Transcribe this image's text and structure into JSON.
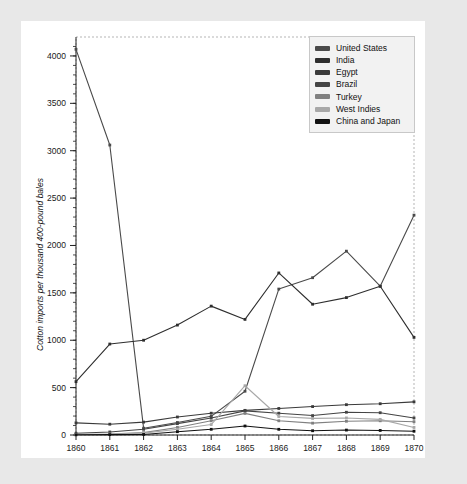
{
  "chart_data": {
    "type": "line",
    "title": "",
    "xlabel": "",
    "ylabel": "Cotton imports per thousand 400-pound bales",
    "categories": [
      "1860",
      "1861",
      "1862",
      "1863",
      "1864",
      "1865",
      "1866",
      "1867",
      "1868",
      "1869",
      "1870"
    ],
    "x": [
      1860,
      1861,
      1862,
      1863,
      1864,
      1865,
      1866,
      1867,
      1868,
      1869,
      1870
    ],
    "xlim": [
      1860,
      1870
    ],
    "ylim": [
      0,
      4200
    ],
    "yticks": [
      0,
      500,
      1000,
      1500,
      2000,
      2500,
      3000,
      3500,
      4000
    ],
    "grid": false,
    "legend_position": "top-right",
    "series": [
      {
        "name": "United States",
        "color": "#4a4a4a",
        "values": [
          4070,
          3060,
          72,
          132,
          197,
          462,
          1540,
          1660,
          1940,
          1570,
          2320
        ]
      },
      {
        "name": "India",
        "color": "#2e2e2e",
        "values": [
          563,
          960,
          1000,
          1160,
          1360,
          1220,
          1710,
          1380,
          1450,
          1570,
          1030
        ]
      },
      {
        "name": "Egypt",
        "color": "#3a3a3a",
        "values": [
          128,
          114,
          136,
          190,
          230,
          260,
          280,
          300,
          320,
          330,
          350
        ]
      },
      {
        "name": "Brazil",
        "color": "#444444",
        "values": [
          18,
          32,
          60,
          120,
          180,
          255,
          230,
          205,
          240,
          235,
          180
        ]
      },
      {
        "name": "Turkey",
        "color": "#808080",
        "values": [
          6,
          10,
          25,
          80,
          150,
          228,
          150,
          125,
          145,
          150,
          140
        ]
      },
      {
        "name": "West Indies",
        "color": "#a8a8a8",
        "values": [
          5,
          8,
          20,
          60,
          110,
          520,
          195,
          175,
          180,
          165,
          80
        ]
      },
      {
        "name": "China and Japan",
        "color": "#111111",
        "values": [
          2,
          4,
          6,
          35,
          60,
          95,
          60,
          45,
          52,
          48,
          40
        ]
      }
    ]
  },
  "legend": {
    "items": [
      {
        "label": "United States"
      },
      {
        "label": "India"
      },
      {
        "label": "Egypt"
      },
      {
        "label": "Brazil"
      },
      {
        "label": "Turkey"
      },
      {
        "label": "West Indies"
      },
      {
        "label": "China and Japan"
      }
    ]
  }
}
